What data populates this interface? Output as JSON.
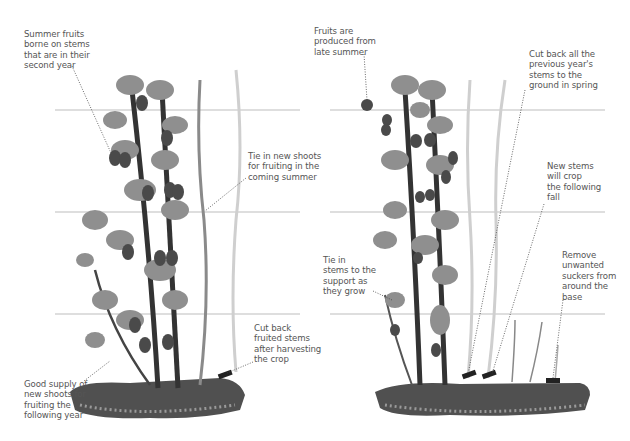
{
  "diagram": {
    "title": "",
    "panels": [
      {
        "id": "summer-fruiting",
        "annotations": [
          {
            "text": "Summer fruits\nborne on stems\nthat are in their\nsecond year",
            "x": 24,
            "y": 29
          },
          {
            "text": "Tie in new shoots\nfor fruiting in the\ncoming summer",
            "x": 248,
            "y": 151
          },
          {
            "text": "Cut back\nfruited stems\nafter harvesting\nthe crop",
            "x": 254,
            "y": 323
          },
          {
            "text": "Good supply of\nnew shoots for\nfruiting the\nfollowing year",
            "x": 24,
            "y": 379
          }
        ]
      },
      {
        "id": "fall-fruiting",
        "annotations": [
          {
            "text": "Fruits are\nproduced from\nlate summer",
            "x": 314,
            "y": 26
          },
          {
            "text": "Cut back all the\nprevious year's\nstems to the\nground in spring",
            "x": 529,
            "y": 49
          },
          {
            "text": "New stems\nwill crop\nthe following\nfall",
            "x": 547,
            "y": 161
          },
          {
            "text": "Remove\nunwanted\nsuckers from\naround the\nbase",
            "x": 562,
            "y": 250
          },
          {
            "text": "Tie in\nstems to the\nsupport as\nthey grow",
            "x": 323,
            "y": 255
          }
        ]
      }
    ],
    "colors": {
      "wire": "#b8b8b8",
      "old_stem": "#3a3a3a",
      "new_stem": "#808080",
      "pale_stem": "#c8c8c8",
      "leaf": "#8c8c8c",
      "fruit": "#4a4a4a",
      "soil": "#505050",
      "text": "#555555"
    }
  }
}
